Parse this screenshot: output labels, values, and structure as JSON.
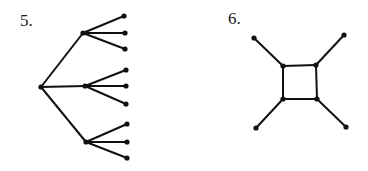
{
  "colors": {
    "background": "#ffffff",
    "stroke": "#111111",
    "label": "#222222"
  },
  "figures": [
    {
      "label": "5.",
      "label_pos": [
        20,
        12
      ],
      "type": "tree",
      "nodes": [
        {
          "id": "r",
          "x": 41,
          "y": 87
        },
        {
          "id": "a",
          "x": 83,
          "y": 33
        },
        {
          "id": "b",
          "x": 85,
          "y": 86
        },
        {
          "id": "c",
          "x": 86,
          "y": 142
        },
        {
          "id": "a1",
          "x": 124,
          "y": 16
        },
        {
          "id": "a2",
          "x": 125,
          "y": 33
        },
        {
          "id": "a3",
          "x": 125,
          "y": 49
        },
        {
          "id": "b1",
          "x": 126,
          "y": 70
        },
        {
          "id": "b2",
          "x": 126,
          "y": 86
        },
        {
          "id": "b3",
          "x": 126,
          "y": 104
        },
        {
          "id": "c1",
          "x": 127,
          "y": 124
        },
        {
          "id": "c2",
          "x": 127,
          "y": 142
        },
        {
          "id": "c3",
          "x": 127,
          "y": 158
        }
      ],
      "edges": [
        [
          "r",
          "a"
        ],
        [
          "r",
          "b"
        ],
        [
          "r",
          "c"
        ],
        [
          "a",
          "a1"
        ],
        [
          "a",
          "a2"
        ],
        [
          "a",
          "a3"
        ],
        [
          "b",
          "b1"
        ],
        [
          "b",
          "b2"
        ],
        [
          "b",
          "b3"
        ],
        [
          "c",
          "c1"
        ],
        [
          "c",
          "c2"
        ],
        [
          "c",
          "c3"
        ]
      ]
    },
    {
      "label": "6.",
      "label_pos": [
        228,
        10
      ],
      "type": "graph",
      "nodes": [
        {
          "id": "tl",
          "x": 283,
          "y": 66
        },
        {
          "id": "tr",
          "x": 316,
          "y": 65
        },
        {
          "id": "bl",
          "x": 283,
          "y": 99
        },
        {
          "id": "br",
          "x": 317,
          "y": 99
        },
        {
          "id": "ltl",
          "x": 254,
          "y": 38
        },
        {
          "id": "ltr",
          "x": 344,
          "y": 35
        },
        {
          "id": "lbl",
          "x": 256,
          "y": 128
        },
        {
          "id": "lbr",
          "x": 346,
          "y": 127
        }
      ],
      "edges": [
        [
          "tl",
          "tr"
        ],
        [
          "tr",
          "br"
        ],
        [
          "br",
          "bl"
        ],
        [
          "bl",
          "tl"
        ],
        [
          "tl",
          "ltl"
        ],
        [
          "tr",
          "ltr"
        ],
        [
          "bl",
          "lbl"
        ],
        [
          "br",
          "lbr"
        ]
      ]
    }
  ]
}
